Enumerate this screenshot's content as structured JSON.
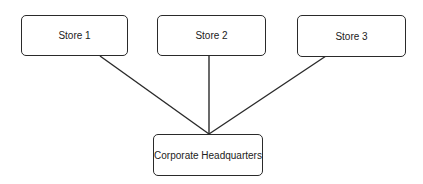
{
  "diagram": {
    "nodes": [
      {
        "id": "store1",
        "label": "Store 1"
      },
      {
        "id": "store2",
        "label": "Store 2"
      },
      {
        "id": "store3",
        "label": "Store 3"
      },
      {
        "id": "hq",
        "label": "Corporate Headquarters"
      }
    ],
    "edges": [
      {
        "from": "store1",
        "to": "hq"
      },
      {
        "from": "store2",
        "to": "hq"
      },
      {
        "from": "store3",
        "to": "hq"
      }
    ]
  }
}
